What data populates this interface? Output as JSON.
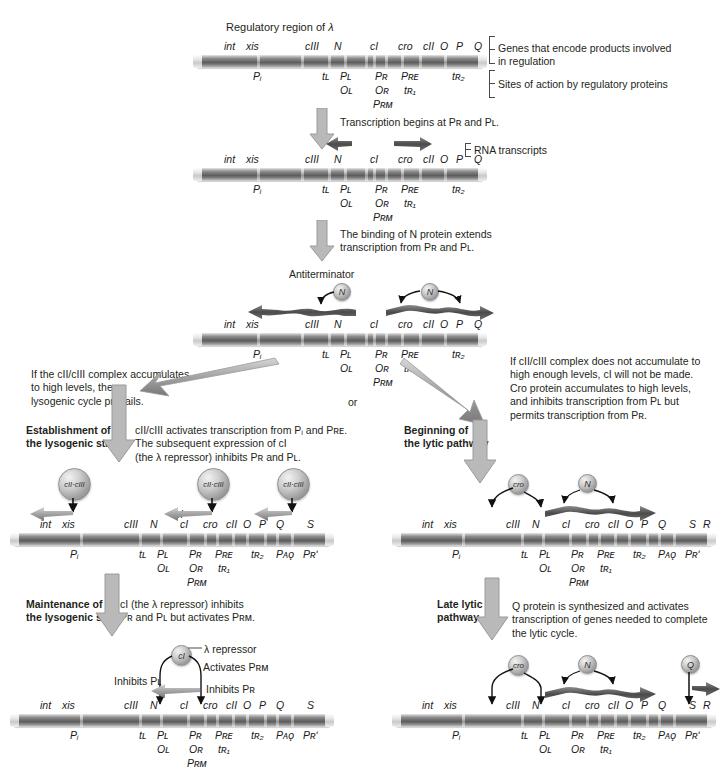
{
  "figure": {
    "title": "Regulatory region of λ",
    "organism": "bacteriophage lambda gene regulation pathway"
  },
  "legend": {
    "genes_bracket": "Genes that encode products involved\nin regulation",
    "sites_bracket": "Sites of action by regulatory proteins",
    "rna_bracket": "RNA transcripts"
  },
  "steps": {
    "step1": "Transcription begins at Pʀ and Pʟ.",
    "step2": "The binding of N protein extends\ntranscription from Pʀ and Pʟ.",
    "antiterminator": "Antiterminator",
    "branch_left": "If the cII/cIII complex accumulates\nto high levels, the\nlysogenic cycle prevails.",
    "branch_or": "or",
    "branch_right": "If cII/cIII complex does not accumulate to\nhigh enough levels, cI will not be made.\nCro protein accumulates to high levels,\nand inhibits transcription from Pʟ but\npermits transcription from Pʀ.",
    "lysogenic_heading": "Establishment of\nthe lysogenic state",
    "lysogenic_body": "cII/cIII activates transcription from Pᵢ and Pʀᴇ.\nThe subsequent expression of cI\n(the λ repressor) inhibits Pʀ and Pʟ.",
    "lytic_heading": "Beginning of\nthe lytic pathway",
    "maintenance_heading": "Maintenance of\nthe lysogenic state",
    "maintenance_body": "cI (the λ repressor) inhibits\nPʀ and Pʟ but activates Pʀᴍ.",
    "late_lytic_heading": "Late lytic\npathway",
    "late_lytic_body": "Q protein is synthesized and activates\ntranscription of genes needed to complete\nthe lytic cycle."
  },
  "annotations": {
    "lambda_repressor": "λ repressor",
    "activates_prm": "Activates Pʀᴍ",
    "inhibits_pl": "Inhibits Pʟ",
    "inhibits_pr": "Inhibits Pʀ"
  },
  "genes": {
    "short": [
      "int",
      "xis",
      "cIII",
      "N",
      "cI",
      "cro",
      "cII",
      "O",
      "P",
      "Q"
    ],
    "extended_left": [
      "int",
      "xis",
      "cIII",
      "N",
      "cI",
      "cro",
      "cII",
      "O",
      "P",
      "Q",
      "S"
    ],
    "extended_both": [
      "int",
      "xis",
      "cIII",
      "N",
      "cI",
      "cro",
      "cII",
      "O",
      "P",
      "Q",
      "S",
      "R"
    ]
  },
  "sites": {
    "short": [
      "Pᵢ",
      "tʟ",
      "Pʟ",
      "Oʟ",
      "Pʀ",
      "Oʀ",
      "Pʀᴍ",
      "Pʀᴇ",
      "tʀ₁",
      "tʀ₂"
    ],
    "extended": [
      "Pᵢ",
      "tʟ",
      "Pʟ",
      "Oʟ",
      "Pʀ",
      "Oʀ",
      "Pʀᴍ",
      "Pʀᴇ",
      "tʀ₁",
      "tʀ₂",
      "Pᴀǫ",
      "Pʀʹ"
    ]
  },
  "proteins": {
    "n": "N",
    "cro": "cro",
    "ci": "cI",
    "q": "Q",
    "cii_ciii": "cII·cIII"
  },
  "colors": {
    "dna_dark": "#5d5d5d",
    "dna_light": "#e9e9e9",
    "arrow_gray": "#a9a9a9",
    "arrow_gray_dark": "#8a8a8a",
    "text": "#231f20",
    "transcript": "#555555"
  }
}
